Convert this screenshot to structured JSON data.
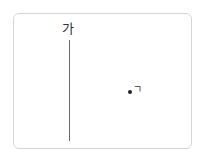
{
  "diagram": {
    "line": {
      "label": "가"
    },
    "point": {
      "label": "ㄱ"
    },
    "colors": {
      "frame": "#d4d4d4",
      "line": "#6a6a6a",
      "point": "#222222",
      "text": "#333333"
    }
  }
}
